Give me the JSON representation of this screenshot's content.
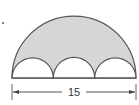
{
  "diagram": {
    "dimension_label": "15",
    "shapes": {
      "large_semicircle": {
        "diameter": 15,
        "fill": "#d6d6d6",
        "stroke": "#555555"
      },
      "small_semicircles": {
        "count": 3,
        "fill": "#ffffff",
        "stroke": "#555555"
      }
    },
    "colors": {
      "shaded_region": "#d6d6d6",
      "stroke": "#555555",
      "background": "#ffffff"
    },
    "marker": "dot"
  }
}
